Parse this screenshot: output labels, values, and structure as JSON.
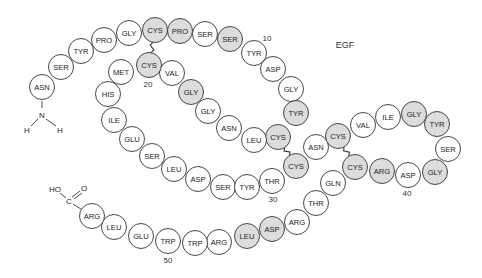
{
  "title": "EGF",
  "colors": {
    "highlight_fill": "#dcdcdc",
    "normal_fill": "#ffffff",
    "stroke": "#333333"
  },
  "radius": 12.5,
  "residues": [
    {
      "n": 1,
      "name": "ASN",
      "x": 42,
      "y": 87,
      "hl": false
    },
    {
      "n": 2,
      "name": "SER",
      "x": 61,
      "y": 67,
      "hl": false
    },
    {
      "n": 3,
      "name": "TYR",
      "x": 81,
      "y": 51,
      "hl": false
    },
    {
      "n": 4,
      "name": "PRO",
      "x": 104,
      "y": 40,
      "hl": false
    },
    {
      "n": 5,
      "name": "GLY",
      "x": 129,
      "y": 33,
      "hl": false
    },
    {
      "n": 6,
      "name": "CYS",
      "x": 155,
      "y": 30,
      "hl": true
    },
    {
      "n": 7,
      "name": "PRO",
      "x": 180,
      "y": 31,
      "hl": true
    },
    {
      "n": 8,
      "name": "SER",
      "x": 205,
      "y": 34,
      "hl": false
    },
    {
      "n": 9,
      "name": "SER",
      "x": 230,
      "y": 39,
      "hl": true
    },
    {
      "n": 10,
      "name": "TYR",
      "x": 254,
      "y": 53,
      "hl": false
    },
    {
      "n": 11,
      "name": "ASP",
      "x": 273,
      "y": 69,
      "hl": false
    },
    {
      "n": 12,
      "name": "GLY",
      "x": 291,
      "y": 89,
      "hl": false
    },
    {
      "n": 13,
      "name": "TYR",
      "x": 296,
      "y": 113,
      "hl": true
    },
    {
      "n": 14,
      "name": "CYS",
      "x": 278,
      "y": 137,
      "hl": true
    },
    {
      "n": 15,
      "name": "LEU",
      "x": 254,
      "y": 140,
      "hl": false
    },
    {
      "n": 16,
      "name": "ASN",
      "x": 229,
      "y": 128,
      "hl": false
    },
    {
      "n": 17,
      "name": "GLY",
      "x": 208,
      "y": 111,
      "hl": false
    },
    {
      "n": 18,
      "name": "GLY",
      "x": 191,
      "y": 92,
      "hl": true
    },
    {
      "n": 19,
      "name": "VAL",
      "x": 172,
      "y": 73,
      "hl": false
    },
    {
      "n": 20,
      "name": "CYS",
      "x": 149,
      "y": 65,
      "hl": true
    },
    {
      "n": 21,
      "name": "MET",
      "x": 121,
      "y": 72,
      "hl": false
    },
    {
      "n": 22,
      "name": "HIS",
      "x": 108,
      "y": 94,
      "hl": false
    },
    {
      "n": 23,
      "name": "ILE",
      "x": 114,
      "y": 120,
      "hl": false
    },
    {
      "n": 24,
      "name": "GLU",
      "x": 132,
      "y": 139,
      "hl": false
    },
    {
      "n": 25,
      "name": "SER",
      "x": 152,
      "y": 156,
      "hl": false
    },
    {
      "n": 26,
      "name": "LEU",
      "x": 174,
      "y": 169,
      "hl": false
    },
    {
      "n": 27,
      "name": "ASP",
      "x": 198,
      "y": 179,
      "hl": false
    },
    {
      "n": 28,
      "name": "SER",
      "x": 223,
      "y": 187,
      "hl": false
    },
    {
      "n": 29,
      "name": "TYR",
      "x": 247,
      "y": 187,
      "hl": false
    },
    {
      "n": 30,
      "name": "THR",
      "x": 272,
      "y": 181,
      "hl": false
    },
    {
      "n": 31,
      "name": "CYS",
      "x": 296,
      "y": 166,
      "hl": true
    },
    {
      "n": 32,
      "name": "ASN",
      "x": 316,
      "y": 147,
      "hl": false
    },
    {
      "n": 33,
      "name": "CYS",
      "x": 338,
      "y": 136,
      "hl": true
    },
    {
      "n": 34,
      "name": "VAL",
      "x": 363,
      "y": 125,
      "hl": false
    },
    {
      "n": 35,
      "name": "ILE",
      "x": 388,
      "y": 117,
      "hl": false
    },
    {
      "n": 36,
      "name": "GLY",
      "x": 414,
      "y": 114,
      "hl": true
    },
    {
      "n": 37,
      "name": "TYR",
      "x": 437,
      "y": 124,
      "hl": true
    },
    {
      "n": 38,
      "name": "SER",
      "x": 448,
      "y": 149,
      "hl": false
    },
    {
      "n": 39,
      "name": "GLY",
      "x": 435,
      "y": 172,
      "hl": true
    },
    {
      "n": 40,
      "name": "ASP",
      "x": 408,
      "y": 175,
      "hl": false
    },
    {
      "n": 41,
      "name": "ARG",
      "x": 382,
      "y": 171,
      "hl": true
    },
    {
      "n": 42,
      "name": "CYS",
      "x": 355,
      "y": 167,
      "hl": true
    },
    {
      "n": 43,
      "name": "GLN",
      "x": 333,
      "y": 183,
      "hl": false
    },
    {
      "n": 44,
      "name": "THR",
      "x": 316,
      "y": 203,
      "hl": false
    },
    {
      "n": 45,
      "name": "ARG",
      "x": 297,
      "y": 222,
      "hl": false
    },
    {
      "n": 46,
      "name": "ASP",
      "x": 272,
      "y": 229,
      "hl": true
    },
    {
      "n": 47,
      "name": "LEU",
      "x": 247,
      "y": 236,
      "hl": true
    },
    {
      "n": 48,
      "name": "ARG",
      "x": 219,
      "y": 242,
      "hl": false
    },
    {
      "n": 49,
      "name": "TRP",
      "x": 195,
      "y": 243,
      "hl": false
    },
    {
      "n": 50,
      "name": "TRP",
      "x": 168,
      "y": 241,
      "hl": false
    },
    {
      "n": 51,
      "name": "GLU",
      "x": 141,
      "y": 236,
      "hl": false
    },
    {
      "n": 52,
      "name": "LEU",
      "x": 114,
      "y": 227,
      "hl": false
    },
    {
      "n": 53,
      "name": "ARG",
      "x": 92,
      "y": 216,
      "hl": false
    }
  ],
  "disulfide_bonds": [
    {
      "from": 6,
      "to": 20
    },
    {
      "from": 14,
      "to": 31
    },
    {
      "from": 33,
      "to": 42
    }
  ],
  "position_labels": [
    {
      "text": "10",
      "x": 267,
      "y": 38
    },
    {
      "text": "20",
      "x": 148,
      "y": 84
    },
    {
      "text": "30",
      "x": 273,
      "y": 199
    },
    {
      "text": "40",
      "x": 407,
      "y": 193
    },
    {
      "text": "50",
      "x": 168,
      "y": 260
    }
  ],
  "n_terminus": {
    "N": {
      "text": "N",
      "x": 42,
      "y": 115
    },
    "H_left": {
      "text": "H",
      "x": 27,
      "y": 130
    },
    "H_right": {
      "text": "H",
      "x": 60,
      "y": 130
    }
  },
  "c_terminus": {
    "HO": {
      "text": "HO",
      "x": 55,
      "y": 189
    },
    "C": {
      "text": "C",
      "x": 69,
      "y": 201
    },
    "O": {
      "text": "O",
      "x": 84,
      "y": 188
    }
  },
  "title_pos": {
    "x": 345,
    "y": 45
  }
}
